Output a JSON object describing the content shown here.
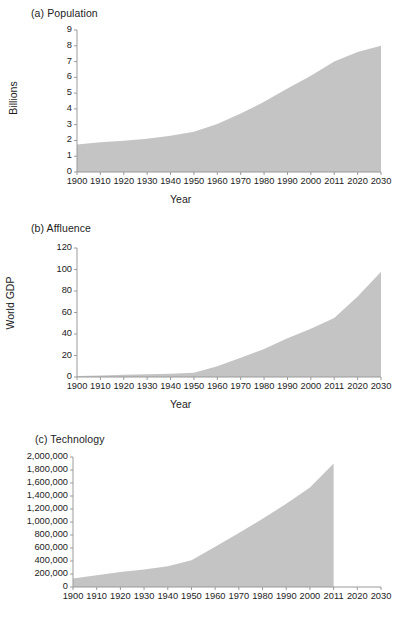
{
  "figure": {
    "background": "#ffffff",
    "fill_color": "#c4c4c4",
    "axis_color": "#9a9a9a",
    "text_color": "#1c1c1c"
  },
  "chart_data": [
    {
      "type": "area",
      "title": "(a) Population",
      "xlabel": "Year",
      "ylabel": "Billions",
      "categories": [
        "1900",
        "1910",
        "1920",
        "1930",
        "1940",
        "1950",
        "1960",
        "1970",
        "1980",
        "1990",
        "2000",
        "2011",
        "2020",
        "2030"
      ],
      "x": [
        1900,
        1910,
        1920,
        1930,
        1940,
        1950,
        1960,
        1970,
        1980,
        1990,
        2000,
        2011,
        2020,
        2030
      ],
      "values": [
        1.75,
        1.88,
        1.98,
        2.1,
        2.3,
        2.55,
        3.05,
        3.7,
        4.45,
        5.3,
        6.1,
        7.0,
        7.6,
        8.0
      ],
      "ylim": [
        0,
        9
      ],
      "yticks": [
        "0",
        "1",
        "2",
        "3",
        "4",
        "5",
        "6",
        "7",
        "8",
        "9"
      ],
      "grid": false,
      "legend": "none"
    },
    {
      "type": "area",
      "title": "(b) Affluence",
      "xlabel": "Year",
      "ylabel": "World GDP",
      "categories": [
        "1900",
        "1910",
        "1920",
        "1930",
        "1940",
        "1950",
        "1960",
        "1970",
        "1980",
        "1990",
        "2000",
        "2011",
        "2020",
        "2030"
      ],
      "x": [
        1900,
        1910,
        1920,
        1930,
        1940,
        1950,
        1960,
        1970,
        1980,
        1990,
        2000,
        2011,
        2020,
        2030
      ],
      "values": [
        1,
        1.5,
        2,
        2.5,
        3,
        4,
        10,
        18,
        26,
        36,
        45,
        55,
        75,
        98
      ],
      "ylim": [
        0,
        120
      ],
      "yticks": [
        "0",
        "20",
        "40",
        "60",
        "80",
        "100",
        "120"
      ],
      "grid": false,
      "legend": "none"
    },
    {
      "type": "area",
      "title": "(c) Technology",
      "xlabel": "",
      "ylabel": "Number of patents",
      "categories": [
        "1900",
        "1910",
        "1920",
        "1930",
        "1940",
        "1950",
        "1960",
        "1970",
        "1980",
        "1990",
        "2000",
        "2011",
        "2020",
        "2030"
      ],
      "x": [
        1900,
        1910,
        1920,
        1930,
        1940,
        1950,
        1960,
        1970,
        1980,
        1990,
        2000,
        2011
      ],
      "values": [
        130000,
        180000,
        230000,
        270000,
        320000,
        410000,
        620000,
        830000,
        1050000,
        1280000,
        1530000,
        1900000
      ],
      "ylim": [
        0,
        2000000
      ],
      "yticks": [
        "0",
        "200,000",
        "400,000",
        "600,000",
        "800,000",
        "1,000,000",
        "1,200,000",
        "1,400,000",
        "1,600,000",
        "1,800,000",
        "2,000,000"
      ],
      "grid": false,
      "legend": "none"
    }
  ]
}
